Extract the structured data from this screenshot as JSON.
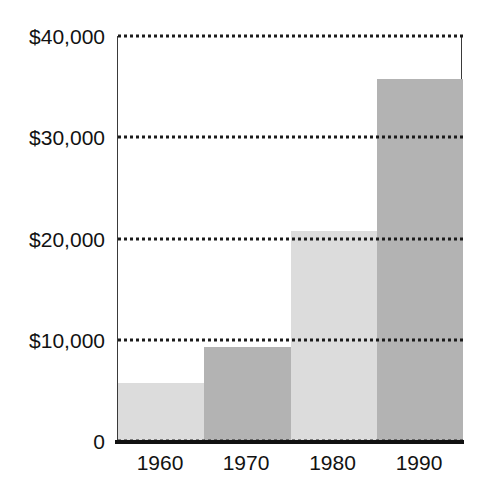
{
  "chart_data": {
    "type": "bar",
    "title": "",
    "subtitle": "",
    "xlabel": "",
    "ylabel": "",
    "categories": [
      "1960",
      "1970",
      "1980",
      "1990"
    ],
    "values": [
      5700,
      9300,
      20700,
      35800
    ],
    "ylim": [
      0,
      40000
    ],
    "yticks": [
      0,
      10000,
      20000,
      30000,
      40000
    ],
    "ytick_labels": [
      "0",
      "$10,000",
      "$20,000",
      "$30,000",
      "$40,000"
    ],
    "grid": true,
    "grid_style": "dotted",
    "legend": "none",
    "bar_colors": [
      "#dcdcdc",
      "#b3b3b3",
      "#dcdcdc",
      "#b3b3b3"
    ],
    "bar_gap": 0,
    "annotations": []
  },
  "axis": {
    "y_labels": [
      {
        "text": "$40,000",
        "value": 40000
      },
      {
        "text": "$30,000",
        "value": 30000
      },
      {
        "text": "$20,000",
        "value": 20000
      },
      {
        "text": "$10,000",
        "value": 10000
      },
      {
        "text": "0",
        "value": 0
      }
    ],
    "x_labels": [
      {
        "text": "1960"
      },
      {
        "text": "1970"
      },
      {
        "text": "1980"
      },
      {
        "text": "1990"
      }
    ]
  },
  "colors": {
    "background": "#ffffff",
    "axis_line": "#111111",
    "gridline": "#1b1b1b",
    "bar_light": "#dcdcdc",
    "bar_dark": "#b3b3b3",
    "text": "#121212"
  }
}
